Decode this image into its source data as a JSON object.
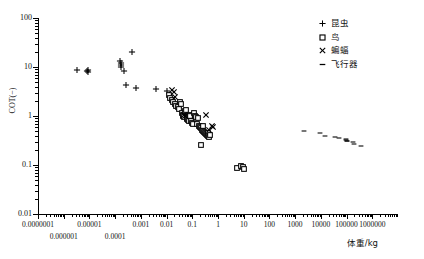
{
  "chart": {
    "type": "scatter",
    "title": "",
    "xlabel": "体重/kg",
    "ylabel": "COT(−)",
    "xscale": "log",
    "yscale": "log",
    "xlim": [
      1e-07,
      10000000.0
    ],
    "ylim": [
      0.01,
      100
    ],
    "grid": false,
    "legend_position": "top-right"
  },
  "axes": {
    "y_ticks": [
      "100",
      "10",
      "1",
      "0.1",
      "0.01"
    ],
    "y_tick_values": [
      100,
      10,
      1,
      0.1,
      0.01
    ],
    "x_ticks_row1": [
      "0.0000001",
      "0.00001",
      "0.001",
      "0.01",
      "0.1",
      "1",
      "10",
      "100",
      "1000",
      "10000",
      "100000",
      "1000000"
    ],
    "x_tick_values_row1": [
      1e-07,
      1e-05,
      0.001,
      0.01,
      0.1,
      1,
      10,
      100,
      1000,
      10000,
      100000,
      1000000
    ],
    "x_ticks_row2": [
      "0.000001",
      "0.0001"
    ],
    "x_tick_values_row2": [
      1e-06,
      0.0001
    ]
  },
  "legend": {
    "items": [
      {
        "label": "昆虫",
        "marker": "plus",
        "key": "insects"
      },
      {
        "label": "鸟",
        "marker": "square",
        "key": "birds"
      },
      {
        "label": "蝙蝠",
        "marker": "cross",
        "key": "bats"
      },
      {
        "label": "飞行器",
        "marker": "dash",
        "key": "aircraft"
      }
    ]
  },
  "chart_data": {
    "type": "scatter",
    "title": "",
    "xlabel": "体重/kg",
    "ylabel": "COT(−)",
    "xscale": "log",
    "yscale": "log",
    "xlim": [
      1e-07,
      10000000.0
    ],
    "ylim": [
      0.01,
      100
    ],
    "grid": false,
    "legend_position": "top-right",
    "series": [
      {
        "name": "昆虫",
        "marker": "plus",
        "points": [
          [
            3.2e-06,
            8.6
          ],
          [
            8e-06,
            8.2
          ],
          [
            8.8e-06,
            7.8
          ],
          [
            8.8e-06,
            8.6
          ],
          [
            0.00016,
            13.5
          ],
          [
            0.000165,
            12.0
          ],
          [
            0.00017,
            11.0
          ],
          [
            0.000175,
            10.2
          ],
          [
            0.00022,
            8.2
          ],
          [
            0.00026,
            4.4
          ],
          [
            0.00046,
            20.0
          ],
          [
            0.00065,
            3.8
          ],
          [
            0.004,
            3.6
          ],
          [
            0.0105,
            3.3
          ]
        ]
      },
      {
        "name": "鸟",
        "marker": "square",
        "points": [
          [
            0.0125,
            2.7
          ],
          [
            0.014,
            2.3
          ],
          [
            0.016,
            2.1
          ],
          [
            0.018,
            1.95
          ],
          [
            0.021,
            1.75
          ],
          [
            0.024,
            1.6
          ],
          [
            0.027,
            1.5
          ],
          [
            0.03,
            1.42
          ],
          [
            0.032,
            1.9
          ],
          [
            0.036,
            1.8
          ],
          [
            0.039,
            1.15
          ],
          [
            0.042,
            1.05
          ],
          [
            0.045,
            1.0
          ],
          [
            0.048,
            0.95
          ],
          [
            0.052,
            1.25
          ],
          [
            0.056,
            1.3
          ],
          [
            0.06,
            0.92
          ],
          [
            0.064,
            0.88
          ],
          [
            0.068,
            0.85
          ],
          [
            0.072,
            0.8
          ],
          [
            0.078,
            1.05
          ],
          [
            0.084,
            1.0
          ],
          [
            0.09,
            0.78
          ],
          [
            0.096,
            0.72
          ],
          [
            0.105,
            0.7
          ],
          [
            0.115,
            1.15
          ],
          [
            0.125,
            1.0
          ],
          [
            0.135,
            0.95
          ],
          [
            0.15,
            0.68
          ],
          [
            0.16,
            0.9
          ],
          [
            0.175,
            0.62
          ],
          [
            0.19,
            0.6
          ],
          [
            0.21,
            0.58
          ],
          [
            0.23,
            0.52
          ],
          [
            0.25,
            0.5
          ],
          [
            0.27,
            0.62
          ],
          [
            0.29,
            0.48
          ],
          [
            0.31,
            0.45
          ],
          [
            0.33,
            0.43
          ],
          [
            0.36,
            0.42
          ],
          [
            0.39,
            0.46
          ],
          [
            0.42,
            0.4
          ],
          [
            0.46,
            0.38
          ],
          [
            0.5,
            0.41
          ],
          [
            0.22,
            0.26
          ],
          [
            5.5,
            0.088
          ],
          [
            8.0,
            0.095
          ],
          [
            9.5,
            0.09
          ],
          [
            10.0,
            0.082
          ]
        ]
      },
      {
        "name": "蝙蝠",
        "marker": "cross",
        "points": [
          [
            0.016,
            3.4
          ],
          [
            0.019,
            3.1
          ],
          [
            0.022,
            2.5
          ],
          [
            0.046,
            1.05
          ],
          [
            0.05,
            1.0
          ],
          [
            0.34,
            1.05
          ],
          [
            0.56,
            0.62
          ],
          [
            0.66,
            0.6
          ],
          [
            0.45,
            0.52
          ]
        ]
      },
      {
        "name": "飞行器",
        "marker": "dash",
        "points": [
          [
            2200.0,
            0.5
          ],
          [
            9000.0,
            0.46
          ],
          [
            15000.0,
            0.4
          ],
          [
            34000.0,
            0.37
          ],
          [
            52000.0,
            0.36
          ],
          [
            95000.0,
            0.345
          ],
          [
            98000.0,
            0.325
          ],
          [
            100000.0,
            0.315
          ],
          [
            105000.0,
            0.305
          ],
          [
            180000.0,
            0.3
          ],
          [
            190000.0,
            0.275
          ],
          [
            360000.0,
            0.24
          ]
        ]
      }
    ]
  }
}
